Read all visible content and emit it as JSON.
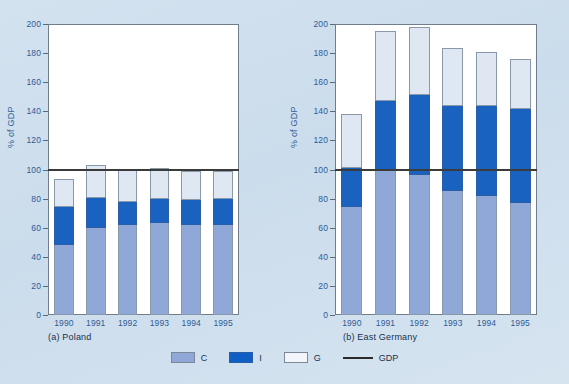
{
  "chart_data": {
    "type": "bar",
    "title": "",
    "subtitle": "",
    "stacked": true,
    "ylabel": "% of GDP",
    "xlabel": "",
    "ylim": [
      0,
      200
    ],
    "ytick_step": 20,
    "yticks": [
      0,
      20,
      40,
      60,
      80,
      100,
      120,
      140,
      160,
      180,
      200
    ],
    "grid": false,
    "legend_position": "bottom-center",
    "legend": [
      {
        "key": "C",
        "label": "C",
        "color": "#8fa8d8",
        "type": "swatch"
      },
      {
        "key": "I",
        "label": "I",
        "color": "#0f5fc4",
        "type": "swatch"
      },
      {
        "key": "G",
        "label": "G",
        "color": "#f2f6fb",
        "type": "swatch"
      },
      {
        "key": "GDP",
        "label": "GDP",
        "color": "#2b2b2b",
        "type": "line"
      }
    ],
    "reference_line": {
      "label": "GDP",
      "value": 100,
      "color": "#2b2b2b"
    },
    "panels": [
      {
        "id": "poland",
        "caption_prefix": "(a)",
        "caption": "Poland",
        "caption_full": "(a) Poland",
        "categories": [
          "1990",
          "1991",
          "1992",
          "1993",
          "1994",
          "1995"
        ],
        "series": [
          {
            "name": "C",
            "values": [
              48,
              59.5,
              62,
              63,
              62,
              62
            ]
          },
          {
            "name": "I",
            "values": [
              26.5,
              21,
              16,
              16.5,
              17,
              18
            ]
          },
          {
            "name": "G",
            "values": [
              18,
              22,
              21,
              21,
              19.5,
              18.5
            ]
          }
        ],
        "totals": [
          92.5,
          102.5,
          99,
          100.5,
          98.5,
          98.5
        ],
        "gdp_line": 100
      },
      {
        "id": "east-germany",
        "caption_prefix": "(b)",
        "caption": "East Germany",
        "caption_full": "(b) East Germany",
        "categories": [
          "1990",
          "1991",
          "1992",
          "1993",
          "1994",
          "1995"
        ],
        "series": [
          {
            "name": "C",
            "values": [
              74,
              99,
              96,
              85,
              82,
              77
            ]
          },
          {
            "name": "I",
            "values": [
              27,
              48,
              55.5,
              58.5,
              61.5,
              64.5
            ]
          },
          {
            "name": "G",
            "values": [
              36.5,
              47.5,
              46,
              39,
              36.5,
              34
            ]
          }
        ],
        "totals": [
          137.5,
          194.5,
          197.5,
          182.5,
          180,
          175.5
        ],
        "gdp_line": 100
      }
    ]
  }
}
